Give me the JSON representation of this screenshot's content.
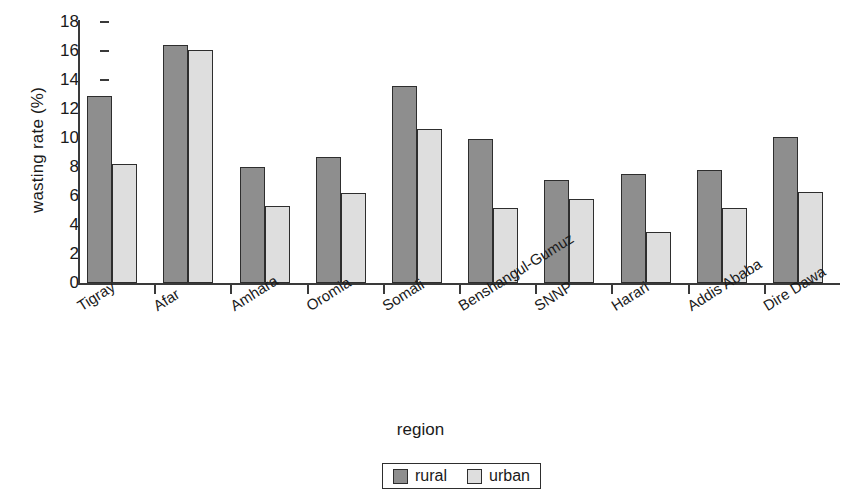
{
  "chart_data": {
    "type": "bar",
    "title": "",
    "xlabel": "region",
    "ylabel": "wasting rate (%)",
    "ylim": [
      0,
      18
    ],
    "ytick_step": 2,
    "yticks": [
      0,
      2,
      4,
      6,
      8,
      10,
      12,
      14,
      16,
      18
    ],
    "grid": false,
    "legend_position": "bottom-center",
    "categories": [
      "Tigray",
      "Afar",
      "Amhara",
      "Oromia",
      "Somali",
      "Benshangul-Gumuz",
      "SNNP",
      "Harari",
      "Addis Ababa",
      "Dire Dawa"
    ],
    "series": [
      {
        "name": "rural",
        "color": "#8e8e8e",
        "values": [
          12.9,
          16.4,
          8.0,
          8.7,
          13.6,
          9.9,
          7.1,
          7.5,
          7.8,
          10.1
        ]
      },
      {
        "name": "urban",
        "color": "#dedede",
        "values": [
          8.2,
          16.1,
          5.3,
          6.2,
          10.6,
          5.2,
          5.8,
          3.5,
          5.2,
          6.3
        ]
      }
    ]
  },
  "legend": {
    "items": [
      {
        "label": "rural",
        "color": "#8e8e8e"
      },
      {
        "label": "urban",
        "color": "#dedede"
      }
    ]
  },
  "axis_colors": {
    "line": "#3a3a3a",
    "bar_outline": "#2e2e2e",
    "text": "#1a1a1a"
  }
}
